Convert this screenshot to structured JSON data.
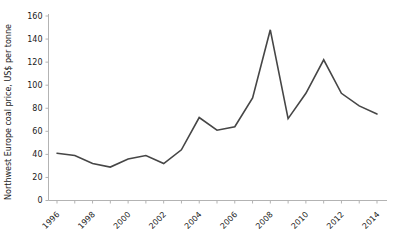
{
  "figure": {
    "background": "#ffffff"
  },
  "chart_data": {
    "type": "line",
    "title": "",
    "xlabel": "",
    "ylabel": "Northwest Europe coal price, US$ per tonne",
    "x": [
      1996,
      1997,
      1998,
      1999,
      2000,
      2001,
      2002,
      2003,
      2004,
      2005,
      2006,
      2007,
      2008,
      2009,
      2010,
      2011,
      2012,
      2013,
      2014
    ],
    "series": [
      {
        "name": "Northwest Europe coal price",
        "values": [
          41,
          39,
          32,
          29,
          36,
          39,
          32,
          44,
          72,
          61,
          64,
          89,
          148,
          71,
          93,
          122,
          93,
          82,
          75
        ]
      }
    ],
    "ylim": [
      0,
      160
    ],
    "yticks": [
      0,
      20,
      40,
      60,
      80,
      100,
      120,
      140,
      160
    ],
    "xtick_label_years": [
      1996,
      1998,
      2000,
      2002,
      2004,
      2006,
      2008,
      2010,
      2012,
      2014
    ],
    "grid": false,
    "legend": "none",
    "line_color": "#464646",
    "axis_color": "#b3b3b3",
    "tick_label_color": "#1a1a1a"
  }
}
